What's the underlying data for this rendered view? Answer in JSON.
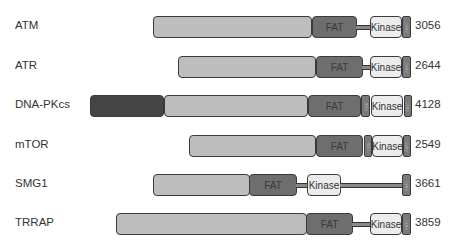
{
  "diagram": {
    "legend_domains": {
      "fat": "FAT",
      "kinase": "Kinase",
      "frb": "FRB",
      "fatc": "FATC"
    },
    "colors": {
      "n_terminal": "#bdbdbd",
      "dna_pkcs_n_terminal": "#454545",
      "fat": "#6e6e6e",
      "kinase": "#ececec",
      "frb_fatc": "#7a7a7a",
      "outline": "#3a3a3a"
    },
    "proteins": [
      {
        "name": "ATM",
        "length": "3056"
      },
      {
        "name": "ATR",
        "length": "2644"
      },
      {
        "name": "DNA-PKcs",
        "length": "4128"
      },
      {
        "name": "mTOR",
        "length": "2549"
      },
      {
        "name": "SMG1",
        "length": "3661"
      },
      {
        "name": "TRRAP",
        "length": "3859"
      }
    ]
  }
}
